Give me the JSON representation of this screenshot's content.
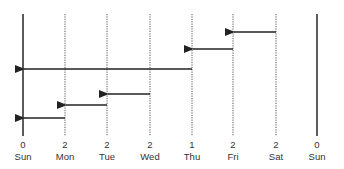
{
  "diagram": {
    "columns": [
      {
        "day": "Sun",
        "count": "0",
        "x": 23,
        "style": "solid"
      },
      {
        "day": "Mon",
        "count": "2",
        "x": 65,
        "style": "dotted"
      },
      {
        "day": "Tue",
        "count": "2",
        "x": 107,
        "style": "dotted"
      },
      {
        "day": "Wed",
        "count": "2",
        "x": 150,
        "style": "dotted"
      },
      {
        "day": "Thu",
        "count": "1",
        "x": 192,
        "style": "dotted"
      },
      {
        "day": "Fri",
        "count": "2",
        "x": 233,
        "style": "dotted"
      },
      {
        "day": "Sat",
        "count": "2",
        "x": 276,
        "style": "dotted"
      },
      {
        "day": "Sun",
        "count": "0",
        "x": 317,
        "style": "solid"
      }
    ],
    "arrows": [
      {
        "from": "Sat",
        "to": "Fri",
        "y": 32
      },
      {
        "from": "Fri",
        "to": "Thu",
        "y": 49
      },
      {
        "from": "Thu",
        "to": "Sun",
        "y": 69
      },
      {
        "from": "Wed",
        "to": "Tue",
        "y": 94
      },
      {
        "from": "Tue",
        "to": "Mon",
        "y": 105
      },
      {
        "from": "Mon",
        "to": "Sun",
        "y": 118
      }
    ],
    "colors": {
      "line": "#333333",
      "dotted": "#555555"
    }
  }
}
